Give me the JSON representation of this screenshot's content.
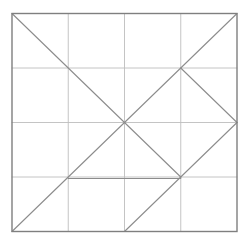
{
  "figure": {
    "background_color": "#ffffff",
    "square": {
      "x": 12,
      "y": 13.5,
      "width": 225,
      "height": 218
    },
    "colors": {
      "border": "#7f7f7f",
      "grid": "#bdbdbd",
      "crease": "#8c8c8c"
    },
    "stroke_widths": {
      "border": 1.4,
      "grid": 0.9,
      "crease": 1.1
    },
    "grid": {
      "vertical_fractions": [
        0.25,
        0.5,
        0.75
      ],
      "horizontal_fractions": [
        0.25,
        0.5,
        0.75
      ]
    },
    "creases": [
      {
        "name": "anti-diagonal-bl-to-tr",
        "from": [
          0,
          1
        ],
        "to": [
          1,
          0
        ]
      },
      {
        "name": "main-diagonal-tl-to-three-quarter",
        "from": [
          0,
          0
        ],
        "to": [
          0.75,
          0.75
        ]
      },
      {
        "name": "right-chevron-upper-arm",
        "from": [
          0.75,
          0.25
        ],
        "to": [
          1,
          0.5
        ]
      },
      {
        "name": "right-chevron-lower-arm",
        "from": [
          1,
          0.5
        ],
        "to": [
          0.75,
          0.75
        ]
      },
      {
        "name": "three-quarter-to-bottom-midpoint",
        "from": [
          0.75,
          0.75
        ],
        "to": [
          0.5,
          1
        ]
      },
      {
        "name": "horizontal-crease-segment",
        "from": [
          0.25,
          0.75
        ],
        "to": [
          0.75,
          0.75
        ],
        "offset_y": 1.5
      }
    ]
  }
}
